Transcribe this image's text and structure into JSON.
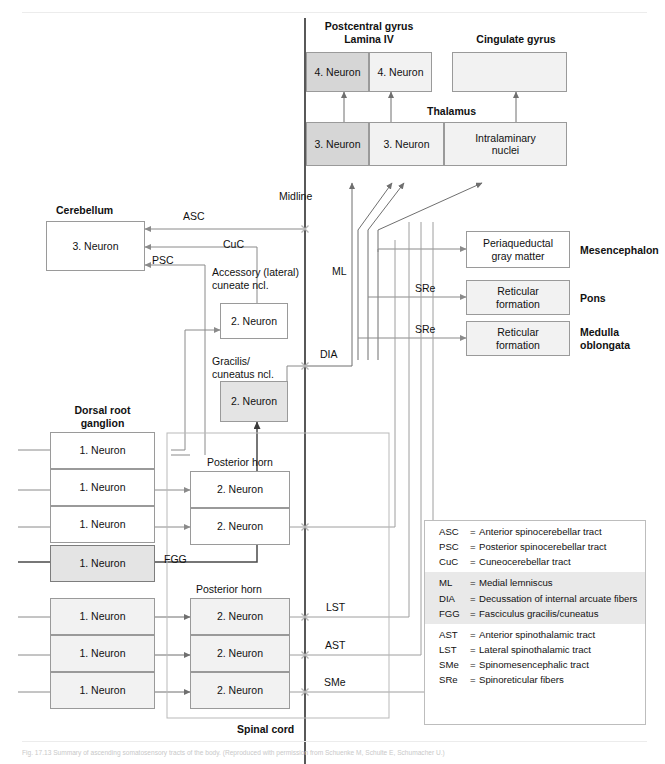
{
  "figure": {
    "caption": "Fig. 17.13 Summary of ascending somatosensory tracts of the body. (Reproduced with permission from Schuenke M, Schulte E, Schumacher U.)"
  },
  "labels": {
    "postcentral_gyrus": "Postcentral gyrus",
    "lamina_iv": "Lamina IV",
    "cingulate_gyrus": "Cingulate gyrus",
    "thalamus": "Thalamus",
    "midline": "Midline",
    "cerebellum": "Cerebellum",
    "accessory_cuneate": "Accessory (lateral)\ncuneate ncl.",
    "gracilis_cuneatus": "Gracilis/\ncuneatus ncl.",
    "dorsal_root_ganglion": "Dorsal root\nganglion",
    "posterior_horn_upper": "Posterior horn",
    "posterior_horn_lower": "Posterior horn",
    "spinal_cord": "Spinal cord",
    "mesencephalon": "Mesencephalon",
    "pons": "Pons",
    "medulla_oblongata": "Medulla\noblongata"
  },
  "tract_labels": {
    "asc": "ASC",
    "psc": "PSC",
    "cuc": "CuC",
    "ml": "ML",
    "dia": "DIA",
    "fgg": "FGG",
    "lst": "LST",
    "ast": "AST",
    "sme": "SMe",
    "sre_pons": "SRe",
    "sre_medulla": "SRe"
  },
  "boxes": {
    "neuron4_left": "4. Neuron",
    "neuron4_right": "4. Neuron",
    "cingulate_empty": "",
    "neuron3_left": "3. Neuron",
    "neuron3_mid": "3. Neuron",
    "intralaminary_nuclei": "Intralaminary\nnuclei",
    "cerebellum_neuron3": "3. Neuron",
    "accessory_neuron2": "2. Neuron",
    "gracilis_neuron2": "2. Neuron",
    "periaqueductal": "Periaqueductal\ngray matter",
    "reticular_pons": "Reticular\nformation",
    "reticular_medulla": "Reticular\nformation",
    "drg": [
      "1. Neuron",
      "1. Neuron",
      "1. Neuron",
      "1. Neuron",
      "1. Neuron",
      "1. Neuron",
      "1. Neuron"
    ],
    "posterior_horn_upper_cells": [
      "2. Neuron",
      "2. Neuron"
    ],
    "posterior_horn_lower_cells": [
      "2. Neuron",
      "2. Neuron",
      "2. Neuron"
    ]
  },
  "legend": {
    "groups": [
      {
        "shaded": false,
        "rows": [
          {
            "abbr": "ASC",
            "eq": "=",
            "def": "Anterior spinocerebellar tract"
          },
          {
            "abbr": "PSC",
            "eq": "=",
            "def": "Posterior spinocerebellar tract"
          },
          {
            "abbr": "CuC",
            "eq": "=",
            "def": "Cuneocerebellar tract"
          }
        ]
      },
      {
        "shaded": true,
        "rows": [
          {
            "abbr": "ML",
            "eq": "=",
            "def": "Medial lemniscus"
          },
          {
            "abbr": "DIA",
            "eq": "=",
            "def": "Decussation of internal arcuate fibers"
          },
          {
            "abbr": "FGG",
            "eq": "=",
            "def": "Fasciculus gracilis/cuneatus"
          }
        ]
      },
      {
        "shaded": false,
        "rows": [
          {
            "abbr": "AST",
            "eq": "=",
            "def": "Anterior spinothalamic tract"
          },
          {
            "abbr": "LST",
            "eq": "=",
            "def": "Lateral spinothalamic tract"
          },
          {
            "abbr": "SMe",
            "eq": "=",
            "def": "Spinomesencephalic tract"
          },
          {
            "abbr": "SRe",
            "eq": "=",
            "def": "Spinoreticular fibers"
          }
        ]
      }
    ]
  },
  "colors": {
    "line": "#8a8a8a",
    "line_dark": "#5a5a5a",
    "fill_light": "#f2f2f2",
    "fill_mid": "#e4e4e4",
    "fill_dark": "#d6d6d6",
    "text": "#111111"
  }
}
